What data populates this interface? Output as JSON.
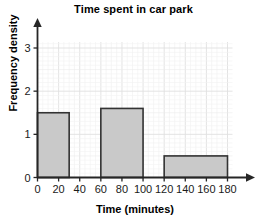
{
  "chart_data": {
    "type": "bar",
    "title": "Time spent in car park",
    "xlabel": "Time (minutes)",
    "ylabel": "Frequency density",
    "xlim": [
      0,
      180
    ],
    "ylim": [
      0,
      3.3
    ],
    "xticks": [
      0,
      20,
      40,
      60,
      80,
      100,
      120,
      140,
      160,
      180
    ],
    "xtick_labels": [
      "0",
      "20",
      "40",
      "60",
      "80",
      "100",
      "120",
      "140",
      "160",
      "180"
    ],
    "yticks": [
      0,
      1,
      2,
      3
    ],
    "ytick_labels": [
      "0",
      "1",
      "2",
      "3"
    ],
    "grid": true,
    "legend": false,
    "bar_fill_color": "#c9c9c9",
    "bar_edge_color": "#333333",
    "axis_color": "#262626",
    "grid_color": "#e8e8e8",
    "bars": [
      {
        "label": "0-30",
        "x_start": 0,
        "x_end": 30,
        "frequency_density": 1.5,
        "frequency": 45
      },
      {
        "label": "60-100",
        "x_start": 60,
        "x_end": 100,
        "frequency_density": 1.6,
        "frequency": 64
      },
      {
        "label": "120-180",
        "x_start": 120,
        "x_end": 180,
        "frequency_density": 0.5,
        "frequency": 30
      }
    ]
  }
}
